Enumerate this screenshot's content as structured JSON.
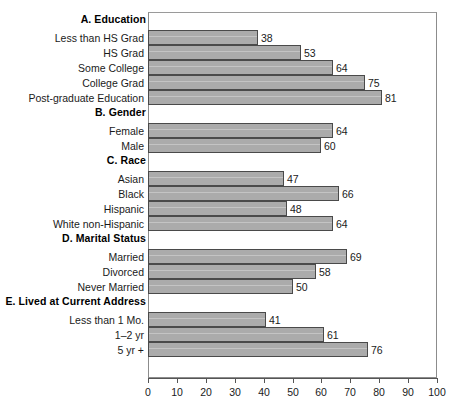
{
  "chart_data": {
    "type": "bar",
    "orientation": "horizontal",
    "title": "",
    "xlabel": "",
    "ylabel": "",
    "xlim": [
      0,
      100
    ],
    "xticks": [
      0,
      10,
      20,
      30,
      40,
      50,
      60,
      70,
      80,
      90,
      100
    ],
    "grid": false,
    "legend": "none",
    "bar_color": "#ababab",
    "bar_border_color": "#4a4a4a",
    "groups": [
      {
        "header": "A. Education",
        "categories": [
          "Less than HS Grad",
          "HS Grad",
          "Some College",
          "College Grad",
          "Post-graduate Education"
        ],
        "values": [
          38,
          53,
          64,
          75,
          81
        ]
      },
      {
        "header": "B. Gender",
        "categories": [
          "Female",
          "Male"
        ],
        "values": [
          64,
          60
        ]
      },
      {
        "header": "C. Race",
        "categories": [
          "Asian",
          "Black",
          "Hispanic",
          "White non-Hispanic"
        ],
        "values": [
          47,
          66,
          48,
          64
        ]
      },
      {
        "header": "D. Marital Status",
        "categories": [
          "Married",
          "Divorced",
          "Never Married"
        ],
        "values": [
          69,
          58,
          50
        ]
      },
      {
        "header": "E. Lived at Current Address",
        "categories": [
          "Less than 1 Mo.",
          "1–2 yr",
          "5 yr +"
        ],
        "values": [
          41,
          61,
          76
        ]
      }
    ]
  },
  "axis": {
    "tick_labels": [
      "0",
      "10",
      "20",
      "30",
      "40",
      "50",
      "60",
      "70",
      "80",
      "90",
      "100"
    ]
  },
  "groups": [
    {
      "header": "A. Education",
      "rows": [
        {
          "label": "Less than HS Grad",
          "value": "38"
        },
        {
          "label": "HS Grad",
          "value": "53"
        },
        {
          "label": "Some College",
          "value": "64"
        },
        {
          "label": "College Grad",
          "value": "75"
        },
        {
          "label": "Post-graduate Education",
          "value": "81"
        }
      ]
    },
    {
      "header": "B. Gender",
      "rows": [
        {
          "label": "Female",
          "value": "64"
        },
        {
          "label": "Male",
          "value": "60"
        }
      ]
    },
    {
      "header": "C. Race",
      "rows": [
        {
          "label": "Asian",
          "value": "47"
        },
        {
          "label": "Black",
          "value": "66"
        },
        {
          "label": "Hispanic",
          "value": "48"
        },
        {
          "label": "White non-Hispanic",
          "value": "64"
        }
      ]
    },
    {
      "header": "D. Marital Status",
      "rows": [
        {
          "label": "Married",
          "value": "69"
        },
        {
          "label": "Divorced",
          "value": "58"
        },
        {
          "label": "Never Married",
          "value": "50"
        }
      ]
    },
    {
      "header": "E. Lived at Current Address",
      "rows": [
        {
          "label": "Less than 1 Mo.",
          "value": "41"
        },
        {
          "label": "1–2 yr",
          "value": "61"
        },
        {
          "label": "5 yr +",
          "value": "76"
        }
      ]
    }
  ]
}
